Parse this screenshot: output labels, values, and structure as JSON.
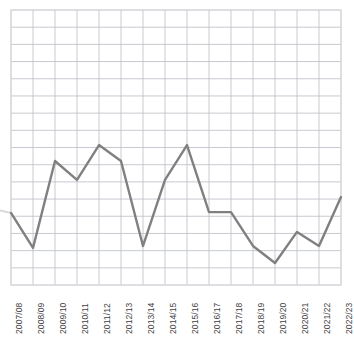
{
  "chart_data": {
    "type": "line",
    "title": "",
    "subtitle": "",
    "xlabel": "",
    "ylabel": "",
    "grid": true,
    "legend": "none",
    "axis_tick_labels_shown": "x-only",
    "y_axis_tick_labels": [],
    "categories": [
      "2007/08",
      "2008/09",
      "2009/10",
      "2010/11",
      "2011/12",
      "2012/13",
      "2013/14",
      "2014/15",
      "2015/16",
      "2016/17",
      "2017/18",
      "2018/19",
      "2019/20",
      "2020/21",
      "2021/22",
      "2022/23"
    ],
    "values": [
      26.2,
      13.5,
      45.1,
      38.2,
      50.9,
      45.1,
      14.2,
      38.2,
      50.9,
      26.5,
      26.5,
      14.2,
      8.0,
      19.3,
      14.2,
      32.0
    ],
    "ylim": [
      0,
      100
    ],
    "xlim_categories": 16,
    "series": [
      {
        "name": "series-1",
        "color": "#808080",
        "line_width": 2.4,
        "markers": false,
        "values": [
          26.2,
          13.5,
          45.1,
          38.2,
          50.9,
          45.1,
          14.2,
          38.2,
          50.9,
          26.5,
          26.5,
          14.2,
          8.0,
          19.3,
          14.2,
          32.0
        ]
      }
    ],
    "grid_rows": 16,
    "grid_cols": 15,
    "colors": {
      "line": "#808080",
      "grid_major": "#b9bcc4",
      "grid_minor": "#e4e6ea",
      "plot_border": "#d6d8dc",
      "tick_text": "#3f3f3f",
      "background": "#ffffff"
    }
  },
  "layout": {
    "plot_left": 11,
    "plot_top": 10,
    "plot_right": 341,
    "plot_bottom": 285,
    "label_baseline_y": 290
  }
}
